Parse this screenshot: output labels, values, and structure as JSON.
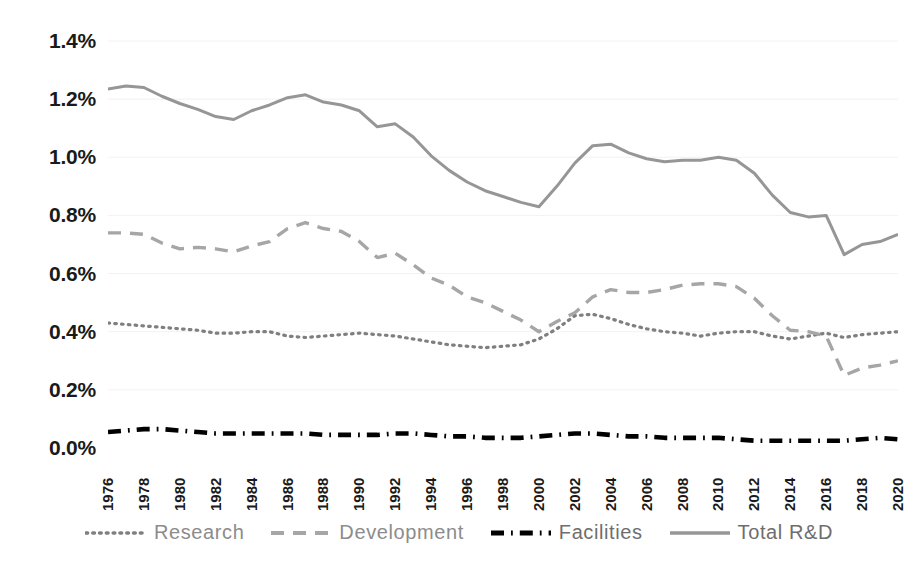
{
  "chart_data": {
    "type": "line",
    "title": "",
    "subtitle": "",
    "xlabel": "",
    "ylabel": "",
    "grid": true,
    "grid_axis": "y",
    "legend_position": "bottom",
    "ylim": [
      0.0,
      1.4
    ],
    "ytick_values": [
      0.0,
      0.2,
      0.4,
      0.6,
      0.8,
      1.0,
      1.2,
      1.4
    ],
    "ytick_labels": [
      "0.0%",
      "0.2%",
      "0.4%",
      "0.6%",
      "0.8%",
      "1.0%",
      "1.2%",
      "1.4%"
    ],
    "xlim": [
      1976,
      2020
    ],
    "xtick_labels": [
      "1976",
      "1978",
      "1980",
      "1982",
      "1984",
      "1986",
      "1988",
      "1990",
      "1992",
      "1994",
      "1996",
      "1998",
      "2000",
      "2002",
      "2004",
      "2006",
      "2008",
      "2010",
      "2012",
      "2014",
      "2016",
      "2018",
      "2020"
    ],
    "x": [
      1976,
      1977,
      1978,
      1979,
      1980,
      1981,
      1982,
      1983,
      1984,
      1985,
      1986,
      1987,
      1988,
      1989,
      1990,
      1991,
      1992,
      1993,
      1994,
      1995,
      1996,
      1997,
      1998,
      1999,
      2000,
      2001,
      2002,
      2003,
      2004,
      2005,
      2006,
      2007,
      2008,
      2009,
      2010,
      2011,
      2012,
      2013,
      2014,
      2015,
      2016,
      2017,
      2018,
      2019,
      2020
    ],
    "series": [
      {
        "name": "Research",
        "style": "dotted",
        "color": "#7f7f7f",
        "values": [
          0.43,
          0.425,
          0.42,
          0.415,
          0.41,
          0.405,
          0.395,
          0.395,
          0.4,
          0.4,
          0.385,
          0.38,
          0.385,
          0.39,
          0.395,
          0.39,
          0.385,
          0.375,
          0.365,
          0.355,
          0.35,
          0.345,
          0.35,
          0.355,
          0.375,
          0.41,
          0.455,
          0.46,
          0.445,
          0.425,
          0.41,
          0.4,
          0.395,
          0.385,
          0.395,
          0.4,
          0.4,
          0.385,
          0.375,
          0.385,
          0.395,
          0.38,
          0.39,
          0.395,
          0.4
        ]
      },
      {
        "name": "Development",
        "style": "dashed",
        "color": "#a6a6a6",
        "values": [
          0.74,
          0.74,
          0.735,
          0.705,
          0.685,
          0.69,
          0.685,
          0.675,
          0.695,
          0.71,
          0.755,
          0.775,
          0.755,
          0.745,
          0.71,
          0.655,
          0.67,
          0.63,
          0.585,
          0.56,
          0.52,
          0.5,
          0.47,
          0.44,
          0.4,
          0.435,
          0.465,
          0.52,
          0.545,
          0.535,
          0.535,
          0.545,
          0.56,
          0.565,
          0.565,
          0.555,
          0.515,
          0.455,
          0.405,
          0.4,
          0.385,
          0.25,
          0.275,
          0.285,
          0.3
        ]
      },
      {
        "name": "Facilities",
        "style": "dashdot",
        "color": "#000000",
        "values": [
          0.055,
          0.06,
          0.065,
          0.065,
          0.06,
          0.055,
          0.05,
          0.05,
          0.05,
          0.05,
          0.05,
          0.05,
          0.045,
          0.045,
          0.045,
          0.045,
          0.05,
          0.05,
          0.045,
          0.04,
          0.04,
          0.035,
          0.035,
          0.035,
          0.04,
          0.045,
          0.05,
          0.05,
          0.045,
          0.04,
          0.04,
          0.035,
          0.035,
          0.035,
          0.035,
          0.03,
          0.025,
          0.025,
          0.025,
          0.025,
          0.025,
          0.025,
          0.03,
          0.035,
          0.03
        ]
      },
      {
        "name": "Total R&D",
        "style": "solid",
        "color": "#969696",
        "values": [
          1.235,
          1.245,
          1.24,
          1.21,
          1.185,
          1.165,
          1.14,
          1.13,
          1.16,
          1.18,
          1.205,
          1.215,
          1.19,
          1.18,
          1.16,
          1.105,
          1.115,
          1.07,
          1.005,
          0.955,
          0.915,
          0.885,
          0.865,
          0.845,
          0.83,
          0.9,
          0.98,
          1.04,
          1.045,
          1.015,
          0.995,
          0.985,
          0.99,
          0.99,
          1.0,
          0.99,
          0.945,
          0.87,
          0.81,
          0.795,
          0.8,
          0.665,
          0.7,
          0.71,
          0.735
        ]
      }
    ]
  },
  "legend": {
    "items": [
      {
        "label": "Research",
        "swatch": "dotted-line-swatch"
      },
      {
        "label": "Development",
        "swatch": "dashed-line-swatch"
      },
      {
        "label": "Facilities",
        "swatch": "dashdot-line-swatch"
      },
      {
        "label": "Total R&D",
        "swatch": "solid-line-swatch"
      }
    ]
  }
}
